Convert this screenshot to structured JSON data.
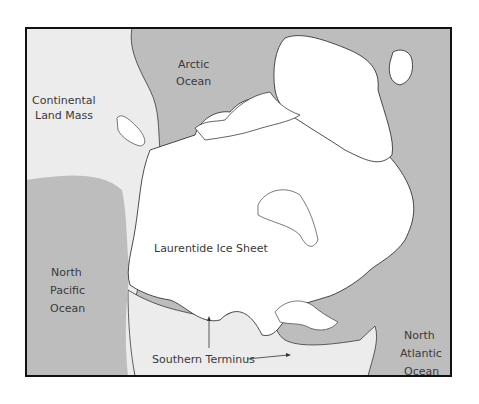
{
  "map": {
    "title": "Laurentide Ice Sheet extent",
    "colors": {
      "ocean": "#bdbdbd",
      "land": "#ececec",
      "ice": "#ffffff",
      "coastline": "#1a1a1a",
      "frame": "#111111",
      "label": "#3a3a3a"
    },
    "labels": {
      "arctic": [
        "Arctic",
        "Ocean"
      ],
      "continental": [
        "Continental",
        "Land Mass"
      ],
      "ice_sheet": "Laurentide Ice Sheet",
      "pacific": [
        "North",
        "Pacific",
        "Ocean"
      ],
      "atlantic": [
        "North",
        "Atlantic",
        "Ocean"
      ],
      "southern_terminus": "Southern Terminus"
    },
    "legend_regions": [
      {
        "name": "Ocean",
        "color": "#bdbdbd"
      },
      {
        "name": "Continental Land Mass",
        "color": "#ececec"
      },
      {
        "name": "Ice Sheet",
        "color": "#ffffff"
      }
    ]
  }
}
